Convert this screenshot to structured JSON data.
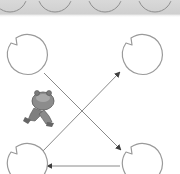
{
  "diagram": {
    "type": "state-graph",
    "colors": {
      "strip_bg": "#d2d2d2",
      "node_stroke": "#9a9a9a",
      "edge_stroke": "#8a8a8a",
      "arrowhead": "#444444",
      "animal_fill": "#8c8c8c"
    },
    "top_strip": {
      "partial_circles": 4
    },
    "nodes": [
      {
        "id": "top-left",
        "cx": 25,
        "cy": 56,
        "r": 20
      },
      {
        "id": "top-right",
        "cx": 140,
        "cy": 56,
        "r": 20
      },
      {
        "id": "bottom-left",
        "cx": 25,
        "cy": 165,
        "r": 20
      },
      {
        "id": "bottom-right",
        "cx": 140,
        "cy": 165,
        "r": 20
      }
    ],
    "edges": [
      {
        "from": "top-left",
        "to": "bottom-right"
      },
      {
        "from": "bottom-left",
        "to": "top-right"
      },
      {
        "from": "bottom-right",
        "to": "bottom-left"
      }
    ],
    "figure": {
      "label": "animal-figure",
      "position": "left-center"
    }
  }
}
